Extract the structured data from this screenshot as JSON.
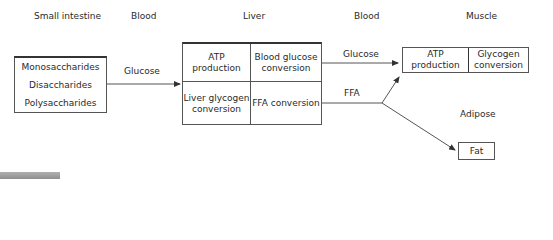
{
  "headers": {
    "small_intestine": "Small intestine",
    "blood_left": "Blood",
    "liver": "Liver",
    "blood_right": "Blood",
    "muscle": "Muscle",
    "adipose": "Adipose"
  },
  "intestine_box": {
    "items": [
      "Monosaccharides",
      "Disaccharides",
      "Polysaccharides"
    ]
  },
  "arrows": {
    "intestine_to_liver": "Glucose",
    "liver_to_muscle": "Glucose",
    "liver_ffa": "FFA"
  },
  "liver_box": {
    "top_left": "ATP production",
    "top_right": "Blood glucose conversion",
    "bottom_left": "Liver glycogen conversion",
    "bottom_right": "FFA conversion"
  },
  "muscle_box": {
    "left": "ATP production",
    "right": "Glycogen conversion"
  },
  "fat_box": {
    "label": "Fat"
  },
  "colors": {
    "line": "#555555",
    "text": "#2a2a2a",
    "gray_bar": "#9a9a9a"
  }
}
